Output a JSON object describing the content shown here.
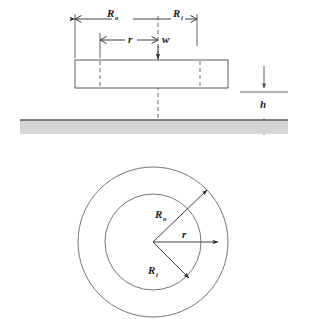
{
  "figure": {
    "colors": {
      "line": "#4a4a4a",
      "dimension": "#2b2b2b",
      "substrate_fill": "#d6d6d6",
      "background": "#ffffff",
      "text": "#1a1a1a"
    },
    "side_view": {
      "name": "side-elevation",
      "dimensions": [
        {
          "id": "outer-radius",
          "symbol": "R",
          "subscript": "o",
          "label": "Ro",
          "description": "outer radius dimension, leftward from centerline"
        },
        {
          "id": "inner-radius",
          "symbol": "R",
          "subscript": "i",
          "label": "Ri",
          "description": "inner radius dimension, rightward from centerline"
        },
        {
          "id": "radial-coordinate",
          "symbol": "r",
          "subscript": "",
          "label": "r",
          "description": "radial coordinate dimension"
        },
        {
          "id": "width",
          "symbol": "w",
          "subscript": "",
          "label": "w",
          "description": "deflection arrow at centerline"
        },
        {
          "id": "height-gap",
          "symbol": "h",
          "subscript": "",
          "label": "h",
          "description": "gap height between plate and substrate"
        }
      ]
    },
    "plan_view": {
      "name": "plan-view",
      "dimensions": [
        {
          "id": "outer-radius-arrow",
          "symbol": "R",
          "subscript": "o",
          "label": "Ro",
          "description": "radius arrow to outer circle, upper right"
        },
        {
          "id": "radial-coordinate-arrow",
          "symbol": "r",
          "subscript": "",
          "label": "r",
          "description": "horizontal radius arrow past inner circle"
        },
        {
          "id": "inner-radius-arrow",
          "symbol": "R",
          "subscript": "i",
          "label": "Ri",
          "description": "radius arrow to inner circle, lower right"
        }
      ],
      "circles": [
        {
          "id": "outer-circle",
          "label": "outer boundary"
        },
        {
          "id": "inner-circle",
          "label": "inner boundary"
        }
      ]
    }
  }
}
